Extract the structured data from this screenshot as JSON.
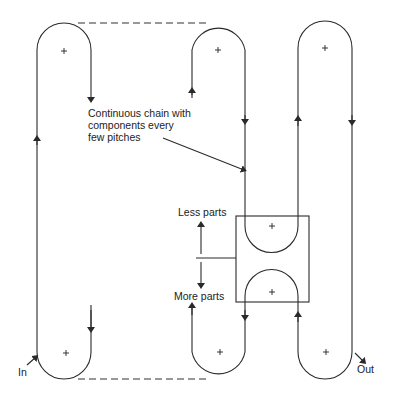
{
  "diagram": {
    "annotation": {
      "lines": [
        "Continuous chain with",
        "components every",
        "few pitches"
      ]
    },
    "labels": {
      "in": "In",
      "out": "Out",
      "less": "Less parts",
      "more": "More parts"
    },
    "colors": {
      "line": "#2a2a2a",
      "background": "#ffffff"
    }
  }
}
